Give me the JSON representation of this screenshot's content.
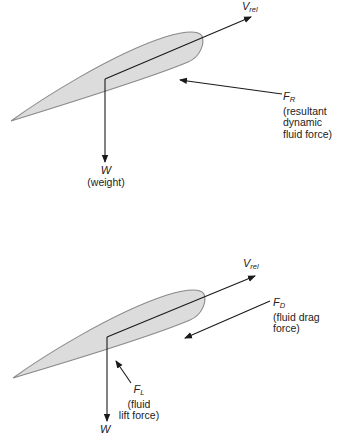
{
  "top_diagram": {
    "v_rel": {
      "symbol": "V",
      "subscript": "rel"
    },
    "resultant": {
      "symbol": "F",
      "subscript": "R",
      "desc_line1": "(resultant",
      "desc_line2": "dynamic",
      "desc_line3": "fluid force)"
    },
    "weight": {
      "symbol": "W",
      "desc": "(weight)"
    }
  },
  "bottom_diagram": {
    "v_rel": {
      "symbol": "V",
      "subscript": "rel"
    },
    "drag": {
      "symbol": "F",
      "subscript": "D",
      "desc_line1": "(fluid drag",
      "desc_line2": "force)"
    },
    "lift": {
      "symbol": "F",
      "subscript": "L",
      "desc_line1": "(fluid",
      "desc_line2": "lift force)"
    },
    "weight": {
      "symbol": "W"
    }
  },
  "colors": {
    "airfoil_fill": "#dcdcdc",
    "airfoil_stroke": "#8a8a8a",
    "vector": "#1a1a1a"
  }
}
